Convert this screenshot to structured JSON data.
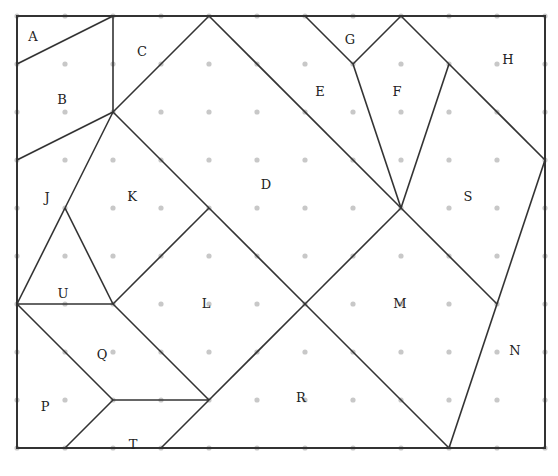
{
  "grid": {
    "origin_x": 17,
    "origin_y": 16,
    "spacing": 48,
    "cols": 11,
    "rows": 9,
    "dot_color": "#c8c8c8",
    "line_color": "#333333"
  },
  "segments": [
    [
      0,
      1,
      2,
      0
    ],
    [
      2,
      0,
      2,
      2
    ],
    [
      0,
      3,
      2,
      2
    ],
    [
      4,
      0,
      2,
      2
    ],
    [
      2,
      2,
      4,
      4
    ],
    [
      4,
      4,
      6,
      6
    ],
    [
      4,
      0,
      8,
      4
    ],
    [
      6,
      0,
      7,
      1
    ],
    [
      7,
      1,
      8,
      0
    ],
    [
      7,
      1,
      8,
      4
    ],
    [
      8,
      4,
      9,
      1
    ],
    [
      8,
      0,
      9,
      1
    ],
    [
      9,
      1,
      11,
      3
    ],
    [
      11,
      3,
      10,
      6
    ],
    [
      8,
      4,
      10,
      6
    ],
    [
      8,
      4,
      6,
      6
    ],
    [
      10,
      6,
      9,
      9
    ],
    [
      6,
      6,
      9,
      9
    ],
    [
      4,
      4,
      2,
      6
    ],
    [
      6,
      6,
      4,
      8
    ],
    [
      2,
      2,
      1,
      4
    ],
    [
      1,
      4,
      0,
      6
    ],
    [
      1,
      4,
      2,
      6
    ],
    [
      0,
      6,
      2,
      6
    ],
    [
      0,
      6,
      2,
      8
    ],
    [
      2,
      6,
      4,
      8
    ],
    [
      2,
      8,
      4,
      8
    ],
    [
      2,
      8,
      1,
      9
    ],
    [
      4,
      8,
      3,
      9
    ]
  ],
  "labels": [
    {
      "text": "A",
      "x": 33,
      "y": 37
    },
    {
      "text": "B",
      "x": 62,
      "y": 100
    },
    {
      "text": "C",
      "x": 142,
      "y": 52
    },
    {
      "text": "D",
      "x": 266,
      "y": 185
    },
    {
      "text": "E",
      "x": 320,
      "y": 92
    },
    {
      "text": "F",
      "x": 397,
      "y": 92
    },
    {
      "text": "G",
      "x": 350,
      "y": 40
    },
    {
      "text": "H",
      "x": 508,
      "y": 60
    },
    {
      "text": "J",
      "x": 47,
      "y": 198
    },
    {
      "text": "K",
      "x": 132,
      "y": 197
    },
    {
      "text": "L",
      "x": 206,
      "y": 304
    },
    {
      "text": "M",
      "x": 400,
      "y": 304
    },
    {
      "text": "N",
      "x": 515,
      "y": 351
    },
    {
      "text": "P",
      "x": 45,
      "y": 407
    },
    {
      "text": "Q",
      "x": 102,
      "y": 355
    },
    {
      "text": "R",
      "x": 301,
      "y": 398
    },
    {
      "text": "S",
      "x": 468,
      "y": 197
    },
    {
      "text": "T",
      "x": 133,
      "y": 445
    },
    {
      "text": "U",
      "x": 63,
      "y": 294
    }
  ]
}
